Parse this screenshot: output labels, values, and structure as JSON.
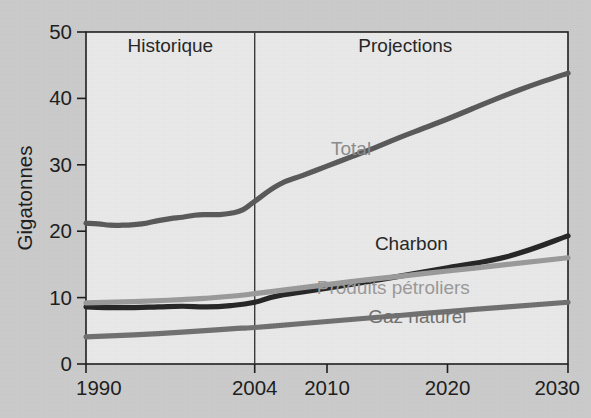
{
  "chart_data": {
    "type": "line",
    "title": "",
    "subtitle": "",
    "xlabel": "",
    "ylabel": "Gigatonnes",
    "xlim": [
      1990,
      2030
    ],
    "ylim": [
      0,
      50
    ],
    "grid": false,
    "legend_position": "inline-annotations",
    "x_ticks": [
      1990,
      2004,
      2010,
      2020,
      2030
    ],
    "x_tick_labels": [
      "1990",
      "2004",
      "2010",
      "2020",
      "2030"
    ],
    "y_ticks": [
      0,
      10,
      20,
      30,
      40,
      50
    ],
    "y_tick_labels": [
      "0",
      "10",
      "20",
      "30",
      "40",
      "50"
    ],
    "annotations": [
      {
        "name": "historique",
        "text": "Historique",
        "x": 1997,
        "y": 47
      },
      {
        "name": "projections",
        "text": "Projections",
        "x": 2016.5,
        "y": 47
      },
      {
        "name": "divider",
        "text": "",
        "x": 2004,
        "y": null
      }
    ],
    "divider_year": 2004,
    "series": [
      {
        "name": "Total",
        "label": "Total",
        "color": "#595959",
        "label_color": "#8b8b8b",
        "label_x": 2012.0,
        "label_y": 31.5,
        "x": [
          1990,
          1991,
          1992,
          1993,
          1994,
          1995,
          1996,
          1997,
          1998,
          1999,
          2000,
          2001,
          2002,
          2003,
          2004,
          2006,
          2008,
          2010,
          2012,
          2014,
          2016,
          2018,
          2020,
          2022,
          2024,
          2026,
          2028,
          2030
        ],
        "values": [
          21.2,
          21.1,
          20.9,
          20.9,
          21.0,
          21.2,
          21.6,
          21.9,
          22.1,
          22.4,
          22.5,
          22.5,
          22.7,
          23.2,
          24.5,
          27.0,
          28.4,
          29.8,
          31.2,
          32.6,
          34.1,
          35.5,
          36.9,
          38.4,
          39.9,
          41.3,
          42.6,
          43.8
        ]
      },
      {
        "name": "Charbon",
        "label": "Charbon",
        "color": "#262626",
        "label_color": "#262626",
        "label_x": 2017.0,
        "label_y": 17.1,
        "x": [
          1990,
          1992,
          1994,
          1996,
          1998,
          2000,
          2002,
          2004,
          2006,
          2010,
          2015,
          2020,
          2025,
          2030
        ],
        "values": [
          8.6,
          8.5,
          8.5,
          8.6,
          8.7,
          8.6,
          8.8,
          9.3,
          10.3,
          11.4,
          12.9,
          14.5,
          16.2,
          19.3
        ]
      },
      {
        "name": "Produits pétroliers",
        "label": "Produits pétroliers",
        "color": "#9a9a9a",
        "label_color": "#9a9a9a",
        "label_x": 2015.5,
        "label_y": 10.6,
        "x": [
          1990,
          1994,
          1998,
          2000,
          2002,
          2004,
          2008,
          2012,
          2016,
          2020,
          2025,
          2030
        ],
        "values": [
          9.2,
          9.4,
          9.7,
          9.9,
          10.2,
          10.6,
          11.5,
          12.4,
          13.2,
          14.0,
          15.0,
          16.0
        ]
      },
      {
        "name": "Gaz naturel",
        "label": "Gaz naturel",
        "color": "#707070",
        "label_color": "#707070",
        "label_x": 2017.5,
        "label_y": 6.1,
        "x": [
          1990,
          1994,
          1998,
          2002,
          2004,
          2008,
          2012,
          2016,
          2020,
          2025,
          2030
        ],
        "values": [
          4.1,
          4.4,
          4.8,
          5.3,
          5.5,
          6.1,
          6.7,
          7.3,
          7.9,
          8.6,
          9.3
        ]
      }
    ]
  },
  "colors": {
    "background": "#cbcbcb",
    "plot_background": "#e9e9e9",
    "axis": "#1d1d1d",
    "total": "#595959",
    "charbon": "#262626",
    "produits_petroliers": "#9a9a9a",
    "gaz_naturel": "#707070"
  }
}
